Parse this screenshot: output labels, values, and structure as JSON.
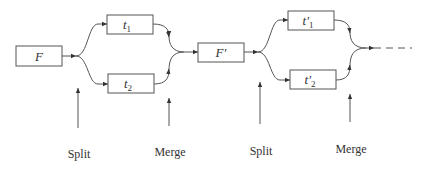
{
  "diagram": {
    "stage1": {
      "source": {
        "label": "F"
      },
      "branch_top": {
        "label": "t",
        "sub": "1"
      },
      "branch_bottom": {
        "label": "t",
        "sub": "2"
      }
    },
    "stage2": {
      "source": {
        "label": "F′"
      },
      "branch_top": {
        "label": "t′",
        "sub": "1"
      },
      "branch_bottom": {
        "label": "t′",
        "sub": "2"
      }
    },
    "annotations": [
      {
        "label": "Split"
      },
      {
        "label": "Merge"
      },
      {
        "label": "Split"
      },
      {
        "label": "Merge"
      }
    ],
    "continuation": "dashed"
  }
}
